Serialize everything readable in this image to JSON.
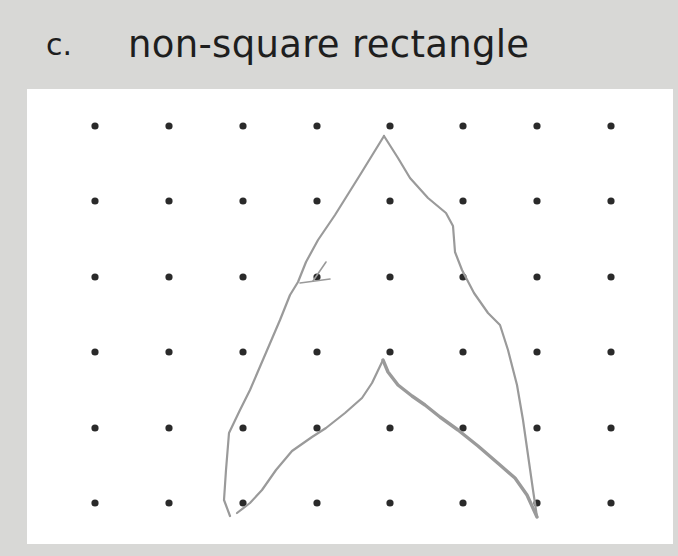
{
  "question": {
    "letter": "c.",
    "title": "non-square rectangle"
  },
  "dot_grid": {
    "columns": 8,
    "rows": 6,
    "dot_x": [
      95,
      169,
      243,
      317,
      390,
      463,
      537,
      611
    ],
    "dot_y": [
      126,
      201,
      277,
      352,
      428,
      503
    ],
    "dot_color": "#2a2a2a"
  },
  "drawing": {
    "description": "hand-drawn arrowhead / chevron shape pointing up, in gray pencil",
    "stroke_color": "#9a9a9a",
    "outer_left_edge": [
      [
        384,
        136
      ],
      [
        360,
        175
      ],
      [
        335,
        215
      ],
      [
        318,
        240
      ],
      [
        306,
        262
      ],
      [
        298,
        282
      ],
      [
        290,
        295
      ],
      [
        280,
        320
      ],
      [
        265,
        355
      ],
      [
        250,
        390
      ],
      [
        240,
        410
      ],
      [
        229,
        433
      ],
      [
        226,
        470
      ],
      [
        224,
        500
      ],
      [
        230,
        516
      ]
    ],
    "outer_right_edge": [
      [
        384,
        136
      ],
      [
        398,
        158
      ],
      [
        410,
        178
      ],
      [
        428,
        198
      ],
      [
        446,
        213
      ],
      [
        453,
        226
      ],
      [
        455,
        252
      ],
      [
        462,
        270
      ],
      [
        474,
        293
      ],
      [
        488,
        313
      ],
      [
        500,
        325
      ],
      [
        508,
        350
      ],
      [
        517,
        385
      ],
      [
        523,
        420
      ],
      [
        528,
        455
      ],
      [
        533,
        490
      ],
      [
        537,
        517
      ]
    ],
    "inner_left_edge": [
      [
        237,
        513
      ],
      [
        250,
        503
      ],
      [
        262,
        490
      ],
      [
        276,
        470
      ],
      [
        292,
        451
      ],
      [
        312,
        437
      ],
      [
        326,
        428
      ],
      [
        345,
        413
      ],
      [
        362,
        398
      ],
      [
        372,
        383
      ],
      [
        383,
        360
      ]
    ],
    "inner_right_edge": [
      [
        383,
        360
      ],
      [
        388,
        372
      ],
      [
        398,
        385
      ],
      [
        412,
        396
      ],
      [
        425,
        405
      ],
      [
        440,
        417
      ],
      [
        458,
        430
      ],
      [
        478,
        446
      ],
      [
        500,
        465
      ],
      [
        515,
        478
      ],
      [
        527,
        495
      ],
      [
        537,
        517
      ]
    ],
    "stray_marks": [
      [
        [
          326,
          262
        ],
        [
          313,
          281
        ]
      ],
      [
        [
          300,
          283
        ],
        [
          330,
          279
        ]
      ]
    ]
  }
}
